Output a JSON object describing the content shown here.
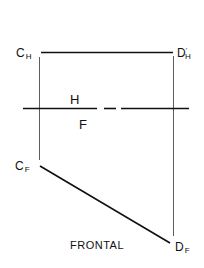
{
  "diagram": {
    "points": {
      "c_h": {
        "main": "C",
        "sub": "H"
      },
      "d_h": {
        "main": "D",
        "sub": "H",
        "prime": "'"
      },
      "c_f": {
        "main": "C",
        "sub": "F"
      },
      "d_f": {
        "main": "D",
        "sub": "F"
      }
    },
    "fold_line": {
      "upper_label": "H",
      "lower_label": "F"
    },
    "view_title": "FRONTAL",
    "colors": {
      "line": "#111111",
      "background": "#ffffff"
    }
  }
}
